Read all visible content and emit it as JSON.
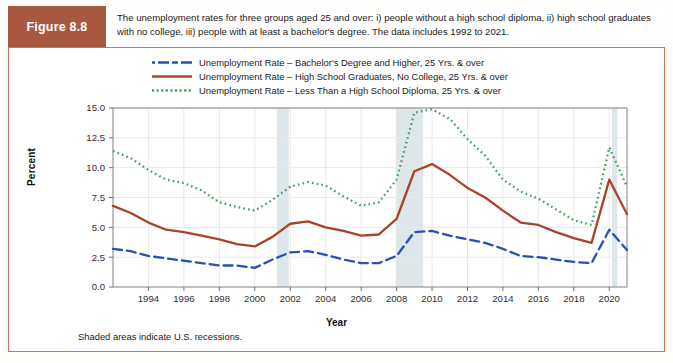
{
  "figure": {
    "label": "Figure 8.8",
    "caption": "The unemployment rates for three groups aged 25 and over: i) people without a high school diploma, ii) high school graduates with no college, iii) people with at least a bachelor's degree. The data includes 1992 to 2021.",
    "footnote": "Shaded areas indicate U.S. recessions.",
    "accent_color": "#a9593f",
    "frame_color": "#c8765a"
  },
  "legend": [
    {
      "label": "Unemployment Rate – Bachelor's Degree and Higher, 25 Yrs. & over",
      "color": "#2a50b4",
      "style": "dashed"
    },
    {
      "label": "Unemployment Rate – High School Graduates, No College, 25 Yrs. & over",
      "color": "#a8432c",
      "style": "solid"
    },
    {
      "label": "Unemployment Rate – Less Than a High School Diploma, 25 Yrs. & over",
      "color": "#3a9e5c",
      "style": "dotted"
    }
  ],
  "chart_data": {
    "type": "line",
    "title": "",
    "xlabel": "Year",
    "ylabel": "Percent",
    "xlim": [
      1992,
      2021
    ],
    "ylim": [
      0.0,
      15.0
    ],
    "yticks": [
      "0.0",
      "2.5",
      "5.0",
      "7.5",
      "10.0",
      "12.5",
      "15.0"
    ],
    "ytick_values": [
      0.0,
      2.5,
      5.0,
      7.5,
      10.0,
      12.5,
      15.0
    ],
    "xticks": [
      "1994",
      "1996",
      "1998",
      "2000",
      "2002",
      "2004",
      "2006",
      "2008",
      "2010",
      "2012",
      "2014",
      "2016",
      "2018",
      "2020"
    ],
    "xtick_values": [
      1994,
      1996,
      1998,
      2000,
      2002,
      2004,
      2006,
      2008,
      2010,
      2012,
      2014,
      2016,
      2018,
      2020
    ],
    "grid": true,
    "legend_position": "above-plot",
    "x": [
      1992,
      1993,
      1994,
      1995,
      1996,
      1997,
      1998,
      1999,
      2000,
      2001,
      2002,
      2003,
      2004,
      2005,
      2006,
      2007,
      2008,
      2009,
      2010,
      2011,
      2012,
      2013,
      2014,
      2015,
      2016,
      2017,
      2018,
      2019,
      2020,
      2021
    ],
    "series": [
      {
        "name": "Unemployment Rate – Bachelor's Degree and Higher, 25 Yrs. & over",
        "color": "#2a50b4",
        "style": "dashed",
        "values": [
          3.2,
          3.0,
          2.6,
          2.4,
          2.2,
          2.0,
          1.8,
          1.8,
          1.6,
          2.3,
          2.9,
          3.0,
          2.7,
          2.3,
          2.0,
          2.0,
          2.6,
          4.6,
          4.7,
          4.3,
          4.0,
          3.7,
          3.2,
          2.6,
          2.5,
          2.3,
          2.1,
          2.0,
          4.8,
          3.1
        ]
      },
      {
        "name": "Unemployment Rate – High School Graduates, No College, 25 Yrs. & over",
        "color": "#a8432c",
        "style": "solid",
        "values": [
          6.8,
          6.2,
          5.4,
          4.8,
          4.6,
          4.3,
          4.0,
          3.6,
          3.4,
          4.2,
          5.3,
          5.5,
          5.0,
          4.7,
          4.3,
          4.4,
          5.7,
          9.7,
          10.3,
          9.4,
          8.3,
          7.5,
          6.4,
          5.4,
          5.2,
          4.6,
          4.1,
          3.7,
          9.0,
          6.1
        ]
      },
      {
        "name": "Unemployment Rate – Less Than a High School Diploma, 25 Yrs. & over",
        "color": "#3a9e5c",
        "style": "dotted",
        "values": [
          11.4,
          10.8,
          9.8,
          9.0,
          8.7,
          8.1,
          7.1,
          6.7,
          6.4,
          7.3,
          8.4,
          8.8,
          8.5,
          7.6,
          6.8,
          7.1,
          9.0,
          14.6,
          14.9,
          14.1,
          12.4,
          11.0,
          9.0,
          8.0,
          7.4,
          6.5,
          5.6,
          5.2,
          11.7,
          8.4
        ]
      }
    ],
    "recessions": [
      {
        "start": 2001.25,
        "end": 2001.92,
        "label": "2001 recession"
      },
      {
        "start": 2007.95,
        "end": 2009.5,
        "label": "2008-09 recession"
      },
      {
        "start": 2020.15,
        "end": 2020.45,
        "label": "2020 recession"
      }
    ],
    "recession_color": "#dde6e9"
  }
}
